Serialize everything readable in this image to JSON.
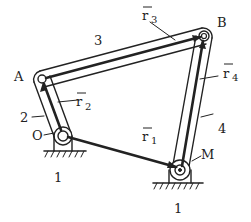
{
  "diagram": {
    "joints": {
      "A": {
        "label": "A",
        "x": 42,
        "y": 79
      },
      "B": {
        "label": "B",
        "x": 204,
        "y": 36
      },
      "O": {
        "label": "O",
        "x": 63,
        "y": 136
      },
      "M": {
        "label": "M",
        "x": 180,
        "y": 170
      }
    },
    "links": {
      "ground_left": "1",
      "ground_right": "1",
      "crank": "2",
      "coupler": "3",
      "rocker": "4"
    },
    "vectors": {
      "r1": {
        "base": "r",
        "sub": "1"
      },
      "r2": {
        "base": "r",
        "sub": "2"
      },
      "r3": {
        "base": "r",
        "sub": "3"
      },
      "r4": {
        "base": "r",
        "sub": "4"
      }
    },
    "colors": {
      "ink": "#222222",
      "background": "#ffffff"
    }
  }
}
